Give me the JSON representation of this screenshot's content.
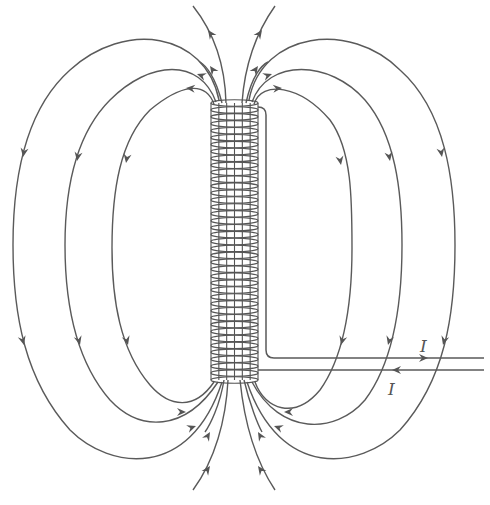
{
  "figure": {
    "labels": {
      "current_top": "I",
      "current_bottom": "I"
    },
    "colors": {
      "line": "#5a5a5a",
      "background": "#ffffff"
    },
    "solenoid": {
      "x_left": 211,
      "x_right": 258,
      "y_top": 103,
      "y_bottom": 380,
      "turns": 40
    },
    "field_loops": {
      "left_count": 3,
      "right_count": 3,
      "axial_lines_top": 2,
      "axial_lines_bottom": 2
    }
  }
}
